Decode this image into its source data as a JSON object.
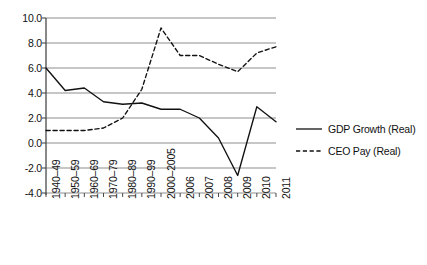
{
  "chart_data": {
    "type": "line",
    "title": "",
    "subtitle": "",
    "xlabel": "",
    "ylabel": "",
    "categories": [
      "1940–49",
      "1950–59",
      "1960–69",
      "1970–79",
      "1980–89",
      "1990–99",
      "2000–2005",
      "2006",
      "2007",
      "2008",
      "2009",
      "2010",
      "2011"
    ],
    "ylim": [
      -4.0,
      10.0
    ],
    "ytick_values": [
      10.0,
      8.0,
      6.0,
      4.0,
      2.0,
      0.0,
      -2.0,
      -4.0
    ],
    "ytick_labels": [
      "10.0",
      "8.0",
      "6.0",
      "4.0",
      "2.0",
      "0.0",
      "-2.0",
      "-4.0"
    ],
    "grid": true,
    "grid_axis": "y",
    "legend_position": "right",
    "series": [
      {
        "name": "GDP Growth (Real)",
        "style": "solid",
        "color": "#111111",
        "values": [
          6.0,
          4.2,
          4.4,
          3.3,
          3.1,
          3.2,
          2.7,
          2.7,
          2.0,
          0.4,
          -2.6,
          2.9,
          1.7
        ]
      },
      {
        "name": "CEO Pay (Real)",
        "style": "dashed",
        "color": "#111111",
        "values": [
          1.0,
          1.0,
          1.0,
          1.2,
          2.0,
          4.3,
          9.2,
          7.0,
          7.0,
          6.3,
          5.7,
          7.2,
          7.7
        ]
      }
    ]
  },
  "legend": {
    "items": [
      {
        "label": "GDP Growth (Real)",
        "style": "solid",
        "swatch_name": "legend-swatch-solid"
      },
      {
        "label": "CEO Pay (Real)",
        "style": "dashed",
        "swatch_name": "legend-swatch-dashed"
      }
    ]
  },
  "axis": {
    "y_ticks": [
      "10.0",
      "8.0",
      "6.0",
      "4.0",
      "2.0",
      "0.0",
      "-2.0",
      "-4.0"
    ],
    "x_ticks": [
      "1940–49",
      "1950–59",
      "1960–69",
      "1970–79",
      "1980–89",
      "1990–99",
      "2000–2005",
      "2006",
      "2007",
      "2008",
      "2009",
      "2010",
      "2011"
    ]
  },
  "colors": {
    "line": "#111111",
    "grid": "#8d8d8d",
    "axis": "#4a4a4a",
    "background": "#ffffff",
    "text": "#111111"
  }
}
